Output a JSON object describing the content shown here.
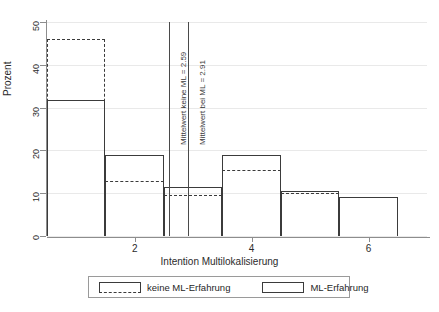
{
  "chart_data": {
    "type": "bar",
    "title": "",
    "xlabel": "Intention Multilokalisierung",
    "ylabel": "Prozent",
    "ylim": [
      0,
      50
    ],
    "xlim": [
      0.5,
      7.0
    ],
    "yticks": [
      0,
      10,
      20,
      30,
      40,
      50
    ],
    "ytick_labels": [
      "0",
      "10",
      "20",
      "30",
      "40",
      "50"
    ],
    "xticks": [
      2,
      4,
      6
    ],
    "xtick_labels": [
      "2",
      "4",
      "6"
    ],
    "grid": "horizontal",
    "legend_position": "bottom",
    "categories": [
      1,
      2,
      3,
      4,
      5,
      6
    ],
    "series": [
      {
        "name": "keine ML-Erfahrung",
        "style": "dashed",
        "values": [
          46.0,
          12.8,
          9.5,
          15.5,
          10.0,
          9.0
        ]
      },
      {
        "name": "ML-Erfahrung",
        "style": "solid",
        "values": [
          31.8,
          19.0,
          11.5,
          19.0,
          10.5,
          9.0
        ]
      }
    ],
    "reference_lines": [
      {
        "label": "Mittelwert keine ML = 2.59",
        "value": 2.59
      },
      {
        "label": "Mittelwert bei ML = 2.91",
        "value": 2.91
      }
    ],
    "colors": {
      "line": "#3b3b3b",
      "axis": "#8d8d8d",
      "grid": "#e9e9e9",
      "background": "#ffffff"
    }
  },
  "axes": {
    "y_label": "Prozent",
    "x_label": "Intention Multilokalisierung",
    "y_ticks": [
      "0",
      "10",
      "20",
      "30",
      "40",
      "50"
    ],
    "x_ticks": [
      "2",
      "4",
      "6"
    ]
  },
  "reference": {
    "line1_label": "Mittelwert keine ML = 2.59",
    "line2_label": "Mittelwert bei ML = 2.91"
  },
  "legend": {
    "item1_label": "keine ML-Erfahrung",
    "item2_label": "ML-Erfahrung"
  }
}
